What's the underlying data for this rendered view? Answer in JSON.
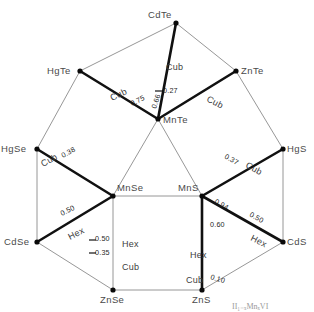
{
  "figure": {
    "caption": "II₁₋ₓMnₓVI"
  },
  "chart_data": {
    "type": "diagram",
    "nodes": [
      {
        "id": "CdTe",
        "label": "CdTe",
        "x": 176,
        "y": 23,
        "label_dx": -28,
        "label_dy": -5
      },
      {
        "id": "HgTe",
        "label": "HgTe",
        "x": 80,
        "y": 71,
        "label_dx": -33,
        "label_dy": 3
      },
      {
        "id": "ZnTe",
        "label": "ZnTe",
        "x": 236,
        "y": 71,
        "label_dx": 5,
        "label_dy": 3
      },
      {
        "id": "MnTe",
        "label": "MnTe",
        "x": 158,
        "y": 119,
        "label_dx": 5,
        "label_dy": 4
      },
      {
        "id": "HgSe",
        "label": "HgSe",
        "x": 37,
        "y": 149,
        "label_dx": -36,
        "label_dy": 3
      },
      {
        "id": "HgS",
        "label": "HgS",
        "x": 283,
        "y": 149,
        "label_dx": 4,
        "label_dy": 3
      },
      {
        "id": "MnSe",
        "label": "MnSe",
        "x": 113,
        "y": 196,
        "label_dx": 4,
        "label_dy": -5
      },
      {
        "id": "MnS",
        "label": "MnS",
        "x": 202,
        "y": 196,
        "label_dx": -24,
        "label_dy": -5
      },
      {
        "id": "CdSe",
        "label": "CdSe",
        "x": 37,
        "y": 242,
        "label_dx": -33,
        "label_dy": 3
      },
      {
        "id": "CdS",
        "label": "CdS",
        "x": 283,
        "y": 242,
        "label_dx": 4,
        "label_dy": 3
      },
      {
        "id": "ZnSe",
        "label": "ZnSe",
        "x": 113,
        "y": 290,
        "label_dx": -13,
        "label_dy": 13
      },
      {
        "id": "ZnS",
        "label": "ZnS",
        "x": 202,
        "y": 290,
        "label_dx": -10,
        "label_dy": 13
      }
    ],
    "edges": [
      {
        "from": "CdTe",
        "to": "HgTe",
        "weight": "thin"
      },
      {
        "from": "CdTe",
        "to": "ZnTe",
        "weight": "thin"
      },
      {
        "from": "CdTe",
        "to": "MnTe",
        "weight": "thick"
      },
      {
        "from": "HgTe",
        "to": "MnTe",
        "weight": "thick"
      },
      {
        "from": "ZnTe",
        "to": "MnTe",
        "weight": "thick"
      },
      {
        "from": "HgTe",
        "to": "HgSe",
        "weight": "thin"
      },
      {
        "from": "ZnTe",
        "to": "HgS",
        "weight": "thin"
      },
      {
        "from": "HgSe",
        "to": "MnSe",
        "weight": "thick"
      },
      {
        "from": "HgS",
        "to": "MnS",
        "weight": "thick"
      },
      {
        "from": "HgSe",
        "to": "CdSe",
        "weight": "thin"
      },
      {
        "from": "HgS",
        "to": "CdS",
        "weight": "thin"
      },
      {
        "from": "MnTe",
        "to": "MnSe",
        "weight": "thin"
      },
      {
        "from": "MnTe",
        "to": "MnS",
        "weight": "thin"
      },
      {
        "from": "MnSe",
        "to": "MnS",
        "weight": "thin"
      },
      {
        "from": "CdSe",
        "to": "MnSe",
        "weight": "thick"
      },
      {
        "from": "CdS",
        "to": "MnS",
        "weight": "thick"
      },
      {
        "from": "CdSe",
        "to": "ZnSe",
        "weight": "thin"
      },
      {
        "from": "CdS",
        "to": "ZnS",
        "weight": "thin"
      },
      {
        "from": "MnSe",
        "to": "ZnSe",
        "weight": "thin"
      },
      {
        "from": "MnS",
        "to": "ZnS",
        "weight": "thick"
      },
      {
        "from": "ZnSe",
        "to": "ZnS",
        "weight": "thin"
      }
    ],
    "structure_labels": [
      {
        "text": "Cub",
        "x": 166,
        "y": 70,
        "rotate": 0,
        "edge": "CdTe-MnTe"
      },
      {
        "text": "Cub",
        "x": 112,
        "y": 101,
        "rotate": -26,
        "edge": "HgTe-MnTe"
      },
      {
        "text": "Cub",
        "x": 206,
        "y": 101,
        "rotate": 27,
        "edge": "ZnTe-MnTe"
      },
      {
        "text": "Cub",
        "x": 43,
        "y": 167,
        "rotate": -29,
        "edge": "HgSe-MnSe"
      },
      {
        "text": "Cub",
        "x": 245,
        "y": 167,
        "rotate": 29,
        "edge": "HgS-MnS"
      },
      {
        "text": "Hex",
        "x": 70,
        "y": 240,
        "rotate": -27,
        "edge": "CdSe-MnSe"
      },
      {
        "text": "Hex",
        "x": 250,
        "y": 240,
        "rotate": 27,
        "edge": "CdS-MnS"
      },
      {
        "text": "Hex",
        "x": 122,
        "y": 247,
        "rotate": 0,
        "edge": "MnSe-ZnSe upper"
      },
      {
        "text": "Cub",
        "x": 122,
        "y": 270,
        "rotate": 0,
        "edge": "MnSe-ZnSe lower"
      },
      {
        "text": "Hex",
        "x": 190,
        "y": 258,
        "rotate": 0,
        "edge": "MnS-ZnS upper"
      },
      {
        "text": "Cub",
        "x": 186,
        "y": 283,
        "rotate": 0,
        "edge": "MnS-ZnS lower"
      }
    ],
    "value_labels": [
      {
        "value": "0.27",
        "x": 163,
        "y": 93,
        "rotate": 0,
        "edge": "CdTe-MnTe"
      },
      {
        "value": "0.75",
        "x": 132,
        "y": 106,
        "rotate": -26,
        "edge": "HgTe-MnTe"
      },
      {
        "value": "0.66",
        "x": 156,
        "y": 109,
        "rotate": -72,
        "edge": "MnTe upper-left"
      },
      {
        "value": "0.38",
        "x": 63,
        "y": 158,
        "rotate": -29,
        "edge": "HgSe-MnSe"
      },
      {
        "value": "0.37",
        "x": 224,
        "y": 158,
        "rotate": 29,
        "edge": "HgS-MnS"
      },
      {
        "value": "0.50",
        "x": 62,
        "y": 216,
        "rotate": -27,
        "edge": "CdSe-MnSe"
      },
      {
        "value": "0.94",
        "x": 214,
        "y": 203,
        "rotate": 29,
        "edge": "MnS-CdS inner"
      },
      {
        "value": "0.50",
        "x": 249,
        "y": 216,
        "rotate": 29,
        "edge": "CdS-MnS"
      },
      {
        "value": "0.50",
        "x": 95,
        "y": 241,
        "rotate": 0,
        "edge": "ZnSe column upper"
      },
      {
        "value": "0.35",
        "x": 95,
        "y": 255,
        "rotate": 0,
        "edge": "ZnSe column lower"
      },
      {
        "value": "0.60",
        "x": 210,
        "y": 227,
        "rotate": 0,
        "edge": "MnS-ZnS"
      },
      {
        "value": "0.10",
        "x": 210,
        "y": 279,
        "rotate": 17,
        "edge": "ZnS lower"
      }
    ],
    "tick_marks": [
      {
        "x1": 155,
        "y1": 91,
        "x2": 162,
        "y2": 91
      },
      {
        "x1": 89,
        "y1": 240,
        "x2": 96,
        "y2": 240
      },
      {
        "x1": 89,
        "y1": 253,
        "x2": 96,
        "y2": 253
      }
    ],
    "colors": {
      "thin_edge": "#8b8b8b",
      "thick_edge": "#111111",
      "node_dot": "#0a0a0a",
      "node_text": "#4a4a4a",
      "value_text": "#1f1f1f",
      "background": "#ffffff"
    }
  }
}
